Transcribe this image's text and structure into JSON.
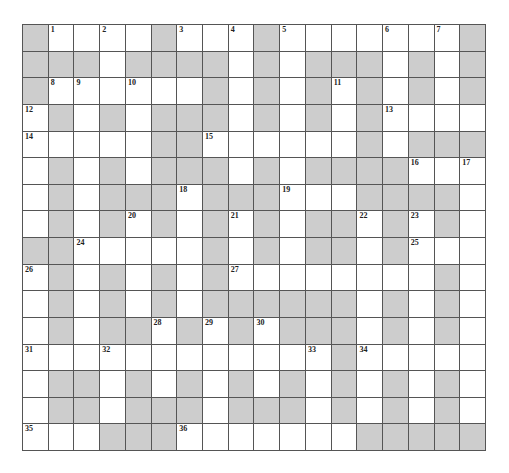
{
  "puzzle": {
    "type": "crossword",
    "cols": 18,
    "rows": 16,
    "colors": {
      "block": "#cdcdcd",
      "open": "#ffffff",
      "border": "#555555",
      "number": "#222222"
    },
    "layout": [
      "#W.W.#W.W#W...W.W#",
      "###.####.#.###.#.#",
      "#WW.W..#.#.#W#.#.#",
      "W#.#.###.#.#.#W...",
      "W....##W.....#.###",
      ".#.#.###.#.####W.W",
      ".#.###W###W..####.",
      ".#.#W#.#W#.##W#W#.",
      "##W....#.#.##.#W..",
      "W#.#.#.#W.......#.",
      ".#.#.#.######.#.#.",
      ".#.##W#W#W###.#.#.",
      "W..W.......W#W....",
      ".##.#.#.#.#.#.#.#.",
      ".##.###.###.#.#.#.",
      "W..###W......#####"
    ],
    "numbers": [
      {
        "n": "1",
        "r": 0,
        "c": 1
      },
      {
        "n": "2",
        "r": 0,
        "c": 3
      },
      {
        "n": "3",
        "r": 0,
        "c": 6
      },
      {
        "n": "4",
        "r": 0,
        "c": 8
      },
      {
        "n": "5",
        "r": 0,
        "c": 10
      },
      {
        "n": "6",
        "r": 0,
        "c": 14
      },
      {
        "n": "7",
        "r": 0,
        "c": 16
      },
      {
        "n": "8",
        "r": 2,
        "c": 1
      },
      {
        "n": "9",
        "r": 2,
        "c": 2
      },
      {
        "n": "10",
        "r": 2,
        "c": 4
      },
      {
        "n": "11",
        "r": 2,
        "c": 12
      },
      {
        "n": "12",
        "r": 3,
        "c": 0
      },
      {
        "n": "13",
        "r": 3,
        "c": 14
      },
      {
        "n": "14",
        "r": 4,
        "c": 0
      },
      {
        "n": "15",
        "r": 4,
        "c": 7
      },
      {
        "n": "16",
        "r": 5,
        "c": 15
      },
      {
        "n": "17",
        "r": 5,
        "c": 17
      },
      {
        "n": "18",
        "r": 6,
        "c": 6
      },
      {
        "n": "19",
        "r": 6,
        "c": 10
      },
      {
        "n": "20",
        "r": 7,
        "c": 4
      },
      {
        "n": "21",
        "r": 7,
        "c": 8
      },
      {
        "n": "22",
        "r": 7,
        "c": 13
      },
      {
        "n": "23",
        "r": 7,
        "c": 15
      },
      {
        "n": "24",
        "r": 8,
        "c": 2
      },
      {
        "n": "25",
        "r": 8,
        "c": 15
      },
      {
        "n": "26",
        "r": 9,
        "c": 0
      },
      {
        "n": "27",
        "r": 9,
        "c": 8
      },
      {
        "n": "28",
        "r": 11,
        "c": 5
      },
      {
        "n": "29",
        "r": 11,
        "c": 7
      },
      {
        "n": "30",
        "r": 11,
        "c": 9
      },
      {
        "n": "31",
        "r": 12,
        "c": 0
      },
      {
        "n": "32",
        "r": 12,
        "c": 3
      },
      {
        "n": "33",
        "r": 12,
        "c": 11
      },
      {
        "n": "34",
        "r": 12,
        "c": 13
      },
      {
        "n": "35",
        "r": 15,
        "c": 0
      },
      {
        "n": "36",
        "r": 15,
        "c": 6
      }
    ]
  }
}
